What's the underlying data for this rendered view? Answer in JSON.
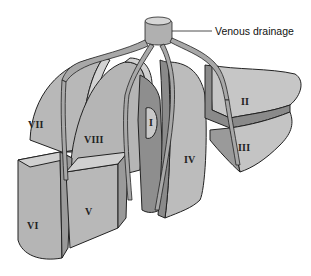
{
  "figure": {
    "callout": {
      "label": "Venous drainage"
    },
    "segments": [
      {
        "id": "I",
        "label": "I"
      },
      {
        "id": "II",
        "label": "II"
      },
      {
        "id": "III",
        "label": "III"
      },
      {
        "id": "IV",
        "label": "IV"
      },
      {
        "id": "V",
        "label": "V"
      },
      {
        "id": "VI",
        "label": "VI"
      },
      {
        "id": "VII",
        "label": "VII"
      },
      {
        "id": "VIII",
        "label": "VIII"
      }
    ]
  },
  "colors": {
    "segment_fill": "#b5b5b5",
    "segment_light": "#cfcfcf",
    "segment_dark": "#8a8a8a",
    "vein_fill": "#a9a9a9",
    "outline": "#222222"
  }
}
